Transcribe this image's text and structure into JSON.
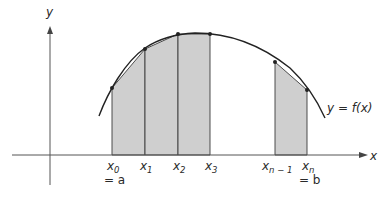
{
  "diagram": {
    "type": "riemann-trapezoid-approximation",
    "colors": {
      "shade": "#cfcfcf",
      "line": "#2a2a2a",
      "axis": "#555555",
      "background": "#ffffff"
    },
    "axes": {
      "x_label": "x",
      "y_label": "y"
    },
    "curve_label": "y = f(x)",
    "points": [
      {
        "id": "x0",
        "label": "x",
        "sub": "0",
        "extra": "= a",
        "px": 112,
        "py": 88
      },
      {
        "id": "x1",
        "label": "x",
        "sub": "1",
        "px": 145,
        "py": 49
      },
      {
        "id": "x2",
        "label": "x",
        "sub": "2",
        "px": 178,
        "py": 34
      },
      {
        "id": "x3",
        "label": "x",
        "sub": "3",
        "px": 210,
        "py": 34
      },
      {
        "id": "xn-1",
        "label": "x",
        "sub": "n − 1",
        "px": 275,
        "py": 62
      },
      {
        "id": "xn",
        "label": "x",
        "sub": "n",
        "extra": "= b",
        "px": 307,
        "py": 90
      }
    ],
    "shaded_strips": [
      [
        "x0",
        "x1"
      ],
      [
        "x1",
        "x2"
      ],
      [
        "x2",
        "x3"
      ],
      [
        "xn-1",
        "xn"
      ]
    ]
  }
}
